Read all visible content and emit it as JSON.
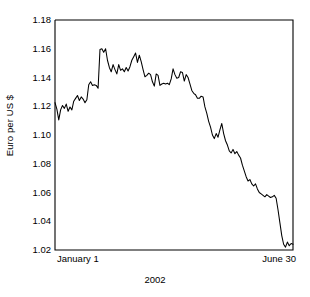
{
  "chart_data": {
    "type": "line",
    "title": "",
    "xlabel": "2002",
    "ylabel": "Euro per US $",
    "ylim": [
      1.02,
      1.18
    ],
    "yticks": [
      "1.18",
      "1.16",
      "1.14",
      "1.12",
      "1.10",
      "1.08",
      "1.06",
      "1.04",
      "1.02"
    ],
    "ytick_values": [
      1.18,
      1.16,
      1.14,
      1.12,
      1.1,
      1.08,
      1.06,
      1.04,
      1.02
    ],
    "xticks": [
      "January 1",
      "June 30"
    ],
    "xlim_labels": {
      "start": "January 1",
      "end": "June 30"
    },
    "grid": false,
    "legend": null,
    "series": [
      {
        "name": "Euro per US $",
        "color": "#000000",
        "values": [
          1.1225,
          1.118,
          1.1105,
          1.1175,
          1.1205,
          1.1185,
          1.1215,
          1.1165,
          1.1195,
          1.1175,
          1.1235,
          1.1255,
          1.1275,
          1.124,
          1.1265,
          1.125,
          1.1225,
          1.1245,
          1.135,
          1.137,
          1.1345,
          1.135,
          1.1345,
          1.1325,
          1.1595,
          1.16,
          1.1575,
          1.16,
          1.152,
          1.147,
          1.144,
          1.149,
          1.1455,
          1.1425,
          1.149,
          1.145,
          1.146,
          1.144,
          1.147,
          1.1445,
          1.1475,
          1.152,
          1.1545,
          1.157,
          1.1505,
          1.1555,
          1.151,
          1.1455,
          1.1405,
          1.1415,
          1.143,
          1.142,
          1.137,
          1.134,
          1.1425,
          1.1415,
          1.1345,
          1.1355,
          1.136,
          1.1355,
          1.136,
          1.135,
          1.139,
          1.146,
          1.142,
          1.1395,
          1.14,
          1.144,
          1.1435,
          1.1375,
          1.142,
          1.14,
          1.1355,
          1.131,
          1.129,
          1.128,
          1.1255,
          1.1255,
          1.127,
          1.1265,
          1.1195,
          1.115,
          1.1095,
          1.1055,
          1.1,
          1.0975,
          1.101,
          1.0985,
          1.1035,
          1.108,
          1.101,
          1.096,
          1.093,
          1.089,
          1.0875,
          1.09,
          1.087,
          1.0885,
          1.086,
          1.084,
          1.079,
          1.075,
          1.071,
          1.068,
          1.069,
          1.066,
          1.0645,
          1.066,
          1.0625,
          1.06,
          1.059,
          1.058,
          1.057,
          1.0585,
          1.0575,
          1.0565,
          1.057,
          1.058,
          1.056,
          1.048,
          1.039,
          1.03,
          1.024,
          1.022,
          1.0255,
          1.023,
          1.0245,
          1.024
        ]
      }
    ]
  },
  "axes": {
    "y_title": "Euro per US $",
    "x_title": "2002",
    "x_start_label": "January 1",
    "x_end_label": "June 30"
  },
  "colors": {
    "line": "#000000",
    "frame": "#000000",
    "background": "#ffffff"
  }
}
